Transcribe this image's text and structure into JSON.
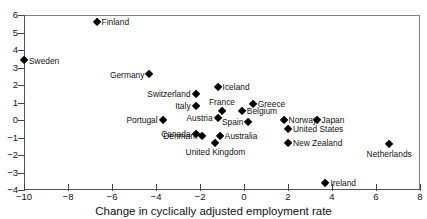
{
  "chart_data": {
    "type": "scatter",
    "title": "",
    "xlabel": "Change in cyclically adjusted employment rate",
    "ylabel": "",
    "xlim": [
      -10,
      8
    ],
    "ylim": [
      -4,
      6
    ],
    "xticks": [
      -10,
      -8,
      -6,
      -4,
      -2,
      0,
      2,
      4,
      6,
      8
    ],
    "xtick_labels": [
      "−10",
      "−8",
      "−6",
      "−4",
      "−2",
      "0",
      "2",
      "4",
      "6",
      "8"
    ],
    "yticks": [
      -4,
      -3,
      -2,
      -1,
      0,
      1,
      2,
      3,
      4,
      5,
      6
    ],
    "ytick_labels": [
      "−4",
      "−3",
      "−2",
      "−1",
      "0",
      "1",
      "2",
      "3",
      "4",
      "5",
      "6"
    ],
    "grid": false,
    "legend": "none",
    "marker": "diamond",
    "marker_color": "#000000",
    "points": [
      {
        "label": "Finland",
        "x": -6.7,
        "y": 5.6,
        "label_pos": "right"
      },
      {
        "label": "Sweden",
        "x": -10.0,
        "y": 3.4,
        "label_pos": "right"
      },
      {
        "label": "Germany",
        "x": -4.3,
        "y": 2.6,
        "label_pos": "left"
      },
      {
        "label": "Iceland",
        "x": -1.2,
        "y": 1.9,
        "label_pos": "right"
      },
      {
        "label": "Switzerland",
        "x": -2.2,
        "y": 1.5,
        "label_pos": "left"
      },
      {
        "label": "Greece",
        "x": 0.4,
        "y": 0.9,
        "label_pos": "right"
      },
      {
        "label": "Italy",
        "x": -2.2,
        "y": 0.8,
        "label_pos": "left"
      },
      {
        "label": "France",
        "x": -1.0,
        "y": 0.5,
        "label_pos": "above"
      },
      {
        "label": "Belgium",
        "x": -0.1,
        "y": 0.5,
        "label_pos": "right"
      },
      {
        "label": "Austria",
        "x": -1.2,
        "y": 0.1,
        "label_pos": "left"
      },
      {
        "label": "Spain",
        "x": 0.2,
        "y": -0.1,
        "label_pos": "left"
      },
      {
        "label": "Norway",
        "x": 1.8,
        "y": 0.0,
        "label_pos": "right"
      },
      {
        "label": "Japan",
        "x": 3.3,
        "y": 0.0,
        "label_pos": "right"
      },
      {
        "label": "Portugal",
        "x": -3.7,
        "y": 0.0,
        "label_pos": "left"
      },
      {
        "label": "United States",
        "x": 2.0,
        "y": -0.5,
        "label_pos": "right"
      },
      {
        "label": "Canada",
        "x": -2.2,
        "y": -0.8,
        "label_pos": "left"
      },
      {
        "label": "Denmark",
        "x": -1.9,
        "y": -0.9,
        "label_pos": "left"
      },
      {
        "label": "Australia",
        "x": -1.1,
        "y": -0.9,
        "label_pos": "right"
      },
      {
        "label": "United Kingdom",
        "x": -1.3,
        "y": -1.3,
        "label_pos": "below"
      },
      {
        "label": "New Zealand",
        "x": 2.0,
        "y": -1.3,
        "label_pos": "right"
      },
      {
        "label": "Netherlands",
        "x": 6.6,
        "y": -1.4,
        "label_pos": "below"
      },
      {
        "label": "Ireland",
        "x": 3.7,
        "y": -3.6,
        "label_pos": "right"
      }
    ]
  }
}
